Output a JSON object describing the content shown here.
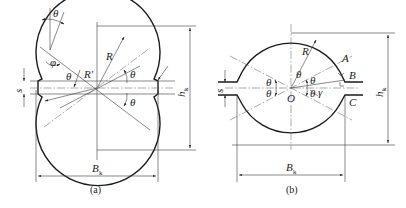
{
  "figure": {
    "panel_a": {
      "caption": "(a)",
      "labels": {
        "theta": "θ",
        "phi": "φ",
        "R": "R",
        "R_prime": "R'",
        "s": "s",
        "h": "h",
        "h_sub": "k",
        "B": "B",
        "B_sub": "k"
      }
    },
    "panel_b": {
      "caption": "(b)",
      "labels": {
        "theta": "θ",
        "gamma": "γ",
        "R": "R",
        "O": "O",
        "A": "A",
        "B_point": "B",
        "C": "C",
        "s": "s",
        "h": "h",
        "h_sub": "k",
        "B": "B",
        "B_sub": "k"
      }
    }
  }
}
